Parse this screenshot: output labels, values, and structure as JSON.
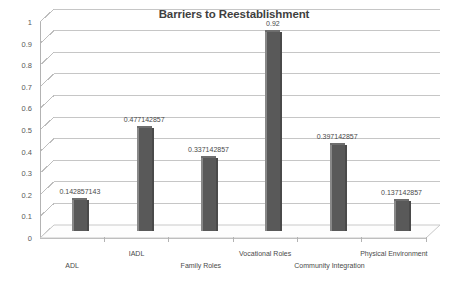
{
  "chart_data": {
    "type": "bar",
    "title": "Barriers to Reestablishment",
    "xlabel": "",
    "ylabel": "",
    "ylim": [
      0,
      1
    ],
    "ytick_labels": [
      "0",
      "0.1",
      "0.2",
      "0.3",
      "0.4",
      "0.5",
      "0.6",
      "0.7",
      "0.8",
      "0.9",
      "1"
    ],
    "ytick_values": [
      0,
      0.1,
      0.2,
      0.3,
      0.4,
      0.5,
      0.6,
      0.7,
      0.8,
      0.9,
      1
    ],
    "grid": true,
    "legend": "none",
    "bar_color": "#595959",
    "background": "#ffffff",
    "categories": [
      "ADL",
      "IADL",
      "Family Roles",
      "Vocational Roles",
      "Community Integration",
      "Physical Environment"
    ],
    "values": [
      0.142857143,
      0.477142857,
      0.337142857,
      0.92,
      0.397142857,
      0.137142857
    ],
    "value_labels": [
      "0.142857143",
      "0.477142857",
      "0.337142857",
      "0.92",
      "0.397142857",
      "0.137142857"
    ]
  }
}
